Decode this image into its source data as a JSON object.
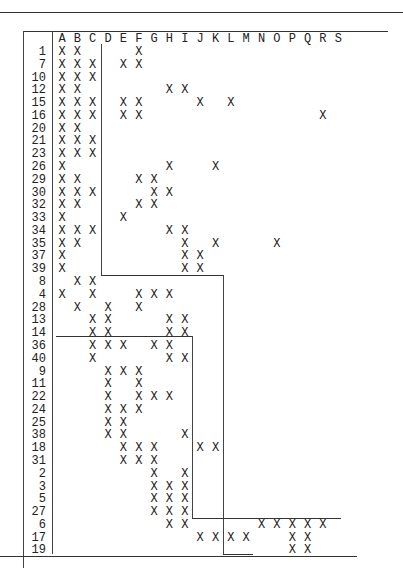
{
  "matrix": {
    "columns": [
      "A",
      "B",
      "C",
      "D",
      "E",
      "F",
      "G",
      "H",
      "I",
      "J",
      "K",
      "L",
      "M",
      "N",
      "O",
      "P",
      "Q",
      "R",
      "S"
    ],
    "mark": "X",
    "rows": [
      {
        "label": "1",
        "cols": [
          "A",
          "B",
          "F"
        ]
      },
      {
        "label": "7",
        "cols": [
          "A",
          "B",
          "C",
          "E",
          "F"
        ]
      },
      {
        "label": "10",
        "cols": [
          "A",
          "B",
          "C"
        ]
      },
      {
        "label": "12",
        "cols": [
          "A",
          "B",
          "H",
          "I"
        ]
      },
      {
        "label": "15",
        "cols": [
          "A",
          "B",
          "C",
          "E",
          "F",
          "J",
          "L"
        ]
      },
      {
        "label": "16",
        "cols": [
          "A",
          "B",
          "C",
          "E",
          "F",
          "R"
        ]
      },
      {
        "label": "20",
        "cols": [
          "A",
          "B"
        ]
      },
      {
        "label": "21",
        "cols": [
          "A",
          "B",
          "C"
        ]
      },
      {
        "label": "23",
        "cols": [
          "A",
          "B",
          "C"
        ]
      },
      {
        "label": "26",
        "cols": [
          "A",
          "H",
          "K"
        ]
      },
      {
        "label": "29",
        "cols": [
          "A",
          "B",
          "F",
          "G"
        ]
      },
      {
        "label": "30",
        "cols": [
          "A",
          "B",
          "C",
          "G",
          "H"
        ]
      },
      {
        "label": "32",
        "cols": [
          "A",
          "B",
          "F",
          "G"
        ]
      },
      {
        "label": "33",
        "cols": [
          "A",
          "E"
        ]
      },
      {
        "label": "34",
        "cols": [
          "A",
          "B",
          "C",
          "H",
          "I"
        ]
      },
      {
        "label": "35",
        "cols": [
          "A",
          "B",
          "I",
          "K",
          "O"
        ]
      },
      {
        "label": "37",
        "cols": [
          "A",
          "I",
          "J"
        ]
      },
      {
        "label": "39",
        "cols": [
          "A",
          "I",
          "J"
        ]
      },
      {
        "label": "8",
        "cols": [
          "B",
          "C"
        ]
      },
      {
        "label": "4",
        "cols": [
          "A",
          "C",
          "F",
          "G",
          "H"
        ]
      },
      {
        "label": "28",
        "cols": [
          "B",
          "D",
          "F"
        ]
      },
      {
        "label": "13",
        "cols": [
          "C",
          "D",
          "H",
          "I"
        ]
      },
      {
        "label": "14",
        "cols": [
          "C",
          "D",
          "H",
          "I"
        ]
      },
      {
        "label": "36",
        "cols": [
          "C",
          "D",
          "E",
          "G",
          "H"
        ]
      },
      {
        "label": "40",
        "cols": [
          "C",
          "H",
          "I"
        ]
      },
      {
        "label": "9",
        "cols": [
          "D",
          "E",
          "F"
        ]
      },
      {
        "label": "11",
        "cols": [
          "D",
          "F"
        ]
      },
      {
        "label": "22",
        "cols": [
          "D",
          "F",
          "G",
          "H"
        ]
      },
      {
        "label": "24",
        "cols": [
          "D",
          "E",
          "F"
        ]
      },
      {
        "label": "25",
        "cols": [
          "D",
          "E"
        ]
      },
      {
        "label": "38",
        "cols": [
          "D",
          "E",
          "I"
        ]
      },
      {
        "label": "18",
        "cols": [
          "E",
          "F",
          "G",
          "J",
          "K"
        ]
      },
      {
        "label": "31",
        "cols": [
          "E",
          "F",
          "G"
        ]
      },
      {
        "label": "2",
        "cols": [
          "G",
          "I"
        ]
      },
      {
        "label": "3",
        "cols": [
          "G",
          "H",
          "I"
        ]
      },
      {
        "label": "5",
        "cols": [
          "G",
          "H",
          "I"
        ]
      },
      {
        "label": "27",
        "cols": [
          "G",
          "H",
          "I"
        ]
      },
      {
        "label": "6",
        "cols": [
          "H",
          "I",
          "N",
          "O",
          "P",
          "Q",
          "R"
        ]
      },
      {
        "label": "17",
        "cols": [
          "J",
          "K",
          "L",
          "M",
          "P",
          "Q"
        ]
      },
      {
        "label": "19",
        "cols": [
          "P",
          "Q"
        ]
      }
    ]
  }
}
